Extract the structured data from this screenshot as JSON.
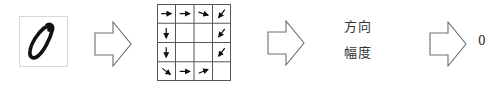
{
  "colors": {
    "stroke": "#6e6e6e",
    "ink": "#111111",
    "grid_line": "#555555",
    "background": "#ffffff"
  },
  "stages": [
    {
      "id": "input",
      "type": "image",
      "content": "handwritten digit 0"
    },
    {
      "id": "arrow1",
      "type": "block-arrow"
    },
    {
      "id": "grid",
      "type": "gradient-grid",
      "rows": 4,
      "cols": 4
    },
    {
      "id": "arrow2",
      "type": "block-arrow"
    },
    {
      "id": "features",
      "type": "text"
    },
    {
      "id": "arrow3",
      "type": "block-arrow"
    },
    {
      "id": "output",
      "type": "text"
    }
  ],
  "features": {
    "direction": "方向",
    "magnitude": "幅度"
  },
  "output": {
    "label": "0"
  },
  "grid": {
    "rows": 4,
    "cols": 4,
    "cells": [
      [
        "right",
        "right",
        "right-down",
        "down-left"
      ],
      [
        "down",
        "",
        "",
        "down-left"
      ],
      [
        "down",
        "",
        "",
        "down-left"
      ],
      [
        "down-right",
        "right",
        "right-up",
        ""
      ]
    ]
  }
}
